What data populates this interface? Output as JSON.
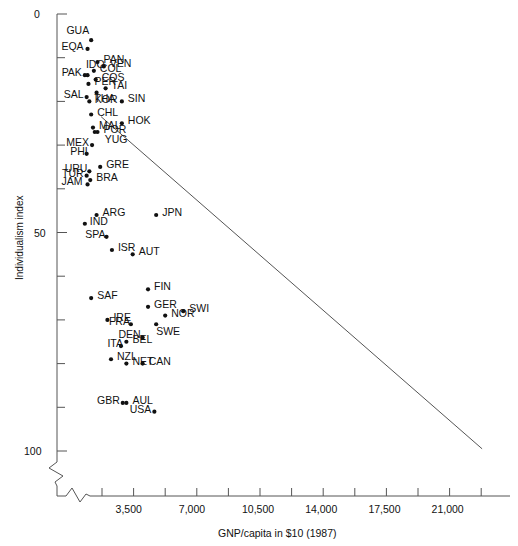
{
  "chart_data": {
    "type": "scatter",
    "title": "Individualism Index versus GNP/capita",
    "xlabel": "GNP/capita in $10 (1987)",
    "ylabel": "Individualism index",
    "xlim": [
      0,
      22750
    ],
    "ylim": [
      0,
      100
    ],
    "y_inverted": true,
    "grid": false,
    "legend": "none",
    "axis_breaks": {
      "x": true,
      "y": true
    },
    "y_ticks_major": [
      0,
      50,
      100
    ],
    "y_tick_labels": [
      "0",
      "50",
      "100"
    ],
    "y_ticks_minor": [
      10,
      20,
      30,
      40,
      60,
      70,
      80,
      90
    ],
    "x_tick_labels": [
      "3,500",
      "7,000",
      "10,500",
      "14,000",
      "17,500",
      "21,000"
    ],
    "x_ticks_labeled": [
      3500,
      7000,
      10500,
      14000,
      17500,
      21000
    ],
    "x_ticks_all": [
      1750,
      3500,
      5250,
      7000,
      8750,
      10500,
      12250,
      14000,
      15750,
      17500,
      19250,
      21000,
      22750
    ],
    "trendline": {
      "x0": 1700,
      "y0": 23.5,
      "x1": 22800,
      "y1": 99.5
    },
    "points": [
      {
        "label": "GUA",
        "x": 1150,
        "y": 6,
        "lx": -28,
        "ly": -11
      },
      {
        "label": "EQA",
        "x": 950,
        "y": 8,
        "lx": -30,
        "ly": -4
      },
      {
        "label": "PAN",
        "x": 1500,
        "y": 11,
        "lx": 6,
        "ly": -4
      },
      {
        "label": "COL",
        "x": 1300,
        "y": 13,
        "lx": 6,
        "ly": -4
      },
      {
        "label": "VEN",
        "x": 1850,
        "y": 12,
        "lx": 6,
        "ly": -4
      },
      {
        "label": "IDO",
        "x": 950,
        "y": 14,
        "lx": -9,
        "ly": -12
      },
      {
        "label": "COS",
        "x": 1400,
        "y": 15,
        "lx": 6,
        "ly": -4
      },
      {
        "label": "PAK",
        "x": 800,
        "y": 14,
        "lx": -29,
        "ly": -4
      },
      {
        "label": "TAI",
        "x": 1950,
        "y": 17,
        "lx": 6,
        "ly": -4
      },
      {
        "label": "PER",
        "x": 1000,
        "y": 16,
        "lx": 6,
        "ly": -4
      },
      {
        "label": "KOR",
        "x": 1450,
        "y": 18,
        "lx": -5,
        "ly": 5
      },
      {
        "label": "SAL",
        "x": 900,
        "y": 19,
        "lx": -29,
        "ly": -4
      },
      {
        "label": "THA",
        "x": 1050,
        "y": 20,
        "lx": 5,
        "ly": -4
      },
      {
        "label": "CHL",
        "x": 1150,
        "y": 23,
        "lx": 6,
        "ly": -4
      },
      {
        "label": "SIN",
        "x": 2850,
        "y": 20,
        "lx": 6,
        "ly": -4
      },
      {
        "label": "MAL",
        "x": 1250,
        "y": 26,
        "lx": 6,
        "ly": -4
      },
      {
        "label": "HOK",
        "x": 2850,
        "y": 25,
        "lx": 6,
        "ly": -4
      },
      {
        "label": "POR",
        "x": 1500,
        "y": 27,
        "lx": 6,
        "ly": -4
      },
      {
        "label": "YUG",
        "x": 1350,
        "y": 27,
        "lx": 10,
        "ly": 6
      },
      {
        "label": "MEX",
        "x": 1200,
        "y": 30,
        "lx": -29,
        "ly": -4
      },
      {
        "label": "PHI",
        "x": 900,
        "y": 32,
        "lx": -25,
        "ly": -4
      },
      {
        "label": "URU",
        "x": 1050,
        "y": 36,
        "lx": -28,
        "ly": -4
      },
      {
        "label": "GRE",
        "x": 1650,
        "y": 35,
        "lx": 6,
        "ly": -4
      },
      {
        "label": "TUR",
        "x": 900,
        "y": 37,
        "lx": -29,
        "ly": -4
      },
      {
        "label": "BRA",
        "x": 1100,
        "y": 38,
        "lx": 6,
        "ly": -4
      },
      {
        "label": "JAM",
        "x": 950,
        "y": 39,
        "lx": -31,
        "ly": -4
      },
      {
        "label": "ARG",
        "x": 1450,
        "y": 46,
        "lx": 6,
        "ly": -4
      },
      {
        "label": "JPN",
        "x": 4750,
        "y": 46,
        "lx": 6,
        "ly": -4
      },
      {
        "label": "IND",
        "x": 800,
        "y": 48,
        "lx": 5,
        "ly": -4
      },
      {
        "label": "SPA",
        "x": 2000,
        "y": 51,
        "lx": -27,
        "ly": -4
      },
      {
        "label": "ISR",
        "x": 2300,
        "y": 54,
        "lx": 6,
        "ly": -4
      },
      {
        "label": "AUT",
        "x": 3450,
        "y": 55,
        "lx": 6,
        "ly": -4
      },
      {
        "label": "FIN",
        "x": 4300,
        "y": 63,
        "lx": 6,
        "ly": -4
      },
      {
        "label": "GER",
        "x": 4300,
        "y": 67,
        "lx": 6,
        "ly": -4
      },
      {
        "label": "SAF",
        "x": 1150,
        "y": 65,
        "lx": 6,
        "ly": -4
      },
      {
        "label": "NOR",
        "x": 5250,
        "y": 69,
        "lx": 6,
        "ly": -4
      },
      {
        "label": "SWI",
        "x": 6250,
        "y": 68,
        "lx": 6,
        "ly": -4
      },
      {
        "label": "IRE",
        "x": 2050,
        "y": 70,
        "lx": 6,
        "ly": -4
      },
      {
        "label": "FRA",
        "x": 3350,
        "y": 71,
        "lx": -27,
        "ly": -4
      },
      {
        "label": "SWE",
        "x": 4750,
        "y": 71,
        "lx": 0,
        "ly": 6
      },
      {
        "label": "ITA",
        "x": 2800,
        "y": 76,
        "lx": -24,
        "ly": -4
      },
      {
        "label": "BEL",
        "x": 3100,
        "y": 75,
        "lx": 6,
        "ly": -4
      },
      {
        "label": "DEN",
        "x": 4000,
        "y": 74,
        "lx": -28,
        "ly": -4
      },
      {
        "label": "NZL",
        "x": 2250,
        "y": 79,
        "lx": 6,
        "ly": -4
      },
      {
        "label": "NET",
        "x": 3100,
        "y": 80,
        "lx": 6,
        "ly": -4
      },
      {
        "label": "CAN",
        "x": 4000,
        "y": 80,
        "lx": 6,
        "ly": -4
      },
      {
        "label": "GBR",
        "x": 2900,
        "y": 89,
        "lx": -29,
        "ly": -4
      },
      {
        "label": "AUL",
        "x": 3100,
        "y": 89,
        "lx": 6,
        "ly": -4
      },
      {
        "label": "USA",
        "x": 4650,
        "y": 91,
        "lx": -29,
        "ly": -4
      }
    ]
  },
  "colors": {
    "point": "#111111",
    "axis": "#555555",
    "text": "#111111",
    "background": "#ffffff"
  }
}
